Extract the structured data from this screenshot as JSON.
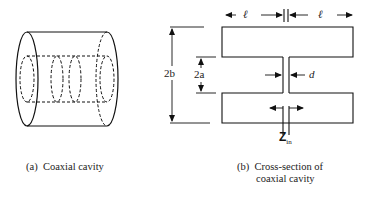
{
  "figure": {
    "panel_a": {
      "caption_prefix": "(a)",
      "caption_text": "Coaxial cavity"
    },
    "panel_b": {
      "caption_prefix": "(b)",
      "caption_line1": "Cross-section of",
      "caption_line2": "coaxial cavity",
      "labels": {
        "length_left": "ℓ",
        "length_right": "ℓ",
        "outer_diameter": "2b",
        "inner_diameter": "2a",
        "gap": "d",
        "input_impedance_main": "Z",
        "input_impedance_sub": "in"
      }
    }
  }
}
